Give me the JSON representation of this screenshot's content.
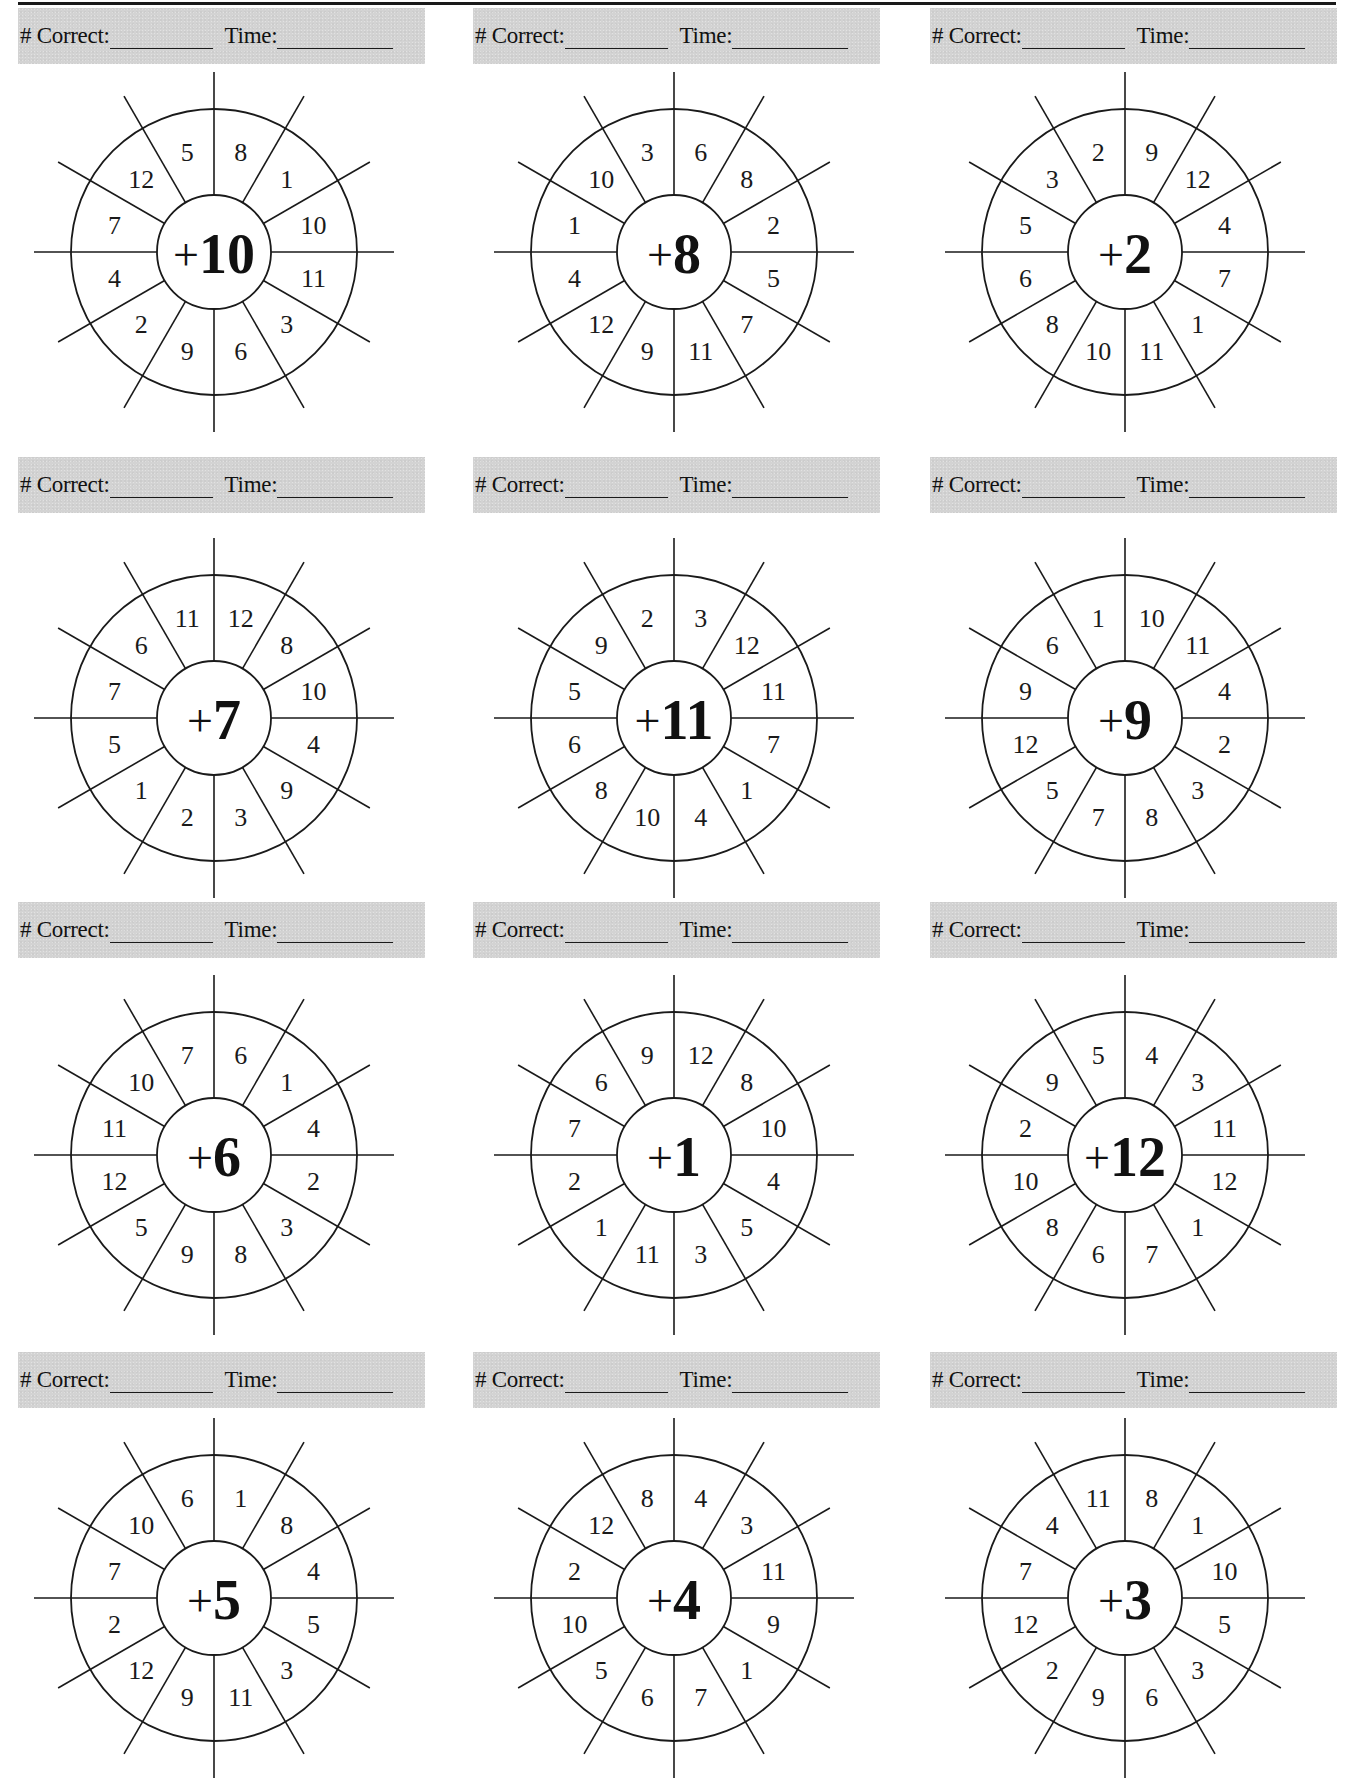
{
  "page": {
    "header_labels": {
      "correct": "# Correct:",
      "time": "Time:"
    },
    "colors": {
      "header_bg": "#d3d3d3",
      "line": "#1a1a1a",
      "text": "#111111"
    }
  },
  "worksheets": [
    {
      "operator": "+",
      "addend": "10",
      "numbers_clockwise_from_top": [
        "8",
        "1",
        "10",
        "11",
        "3",
        "6",
        "9",
        "2",
        "4",
        "7",
        "12",
        "5"
      ]
    },
    {
      "operator": "+",
      "addend": "8",
      "numbers_clockwise_from_top": [
        "6",
        "8",
        "2",
        "5",
        "7",
        "11",
        "9",
        "12",
        "4",
        "1",
        "10",
        "3"
      ]
    },
    {
      "operator": "+",
      "addend": "2",
      "numbers_clockwise_from_top": [
        "9",
        "12",
        "4",
        "7",
        "1",
        "11",
        "10",
        "8",
        "6",
        "5",
        "3",
        "2"
      ]
    },
    {
      "operator": "+",
      "addend": "7",
      "numbers_clockwise_from_top": [
        "12",
        "8",
        "10",
        "4",
        "9",
        "3",
        "2",
        "1",
        "5",
        "7",
        "6",
        "11"
      ]
    },
    {
      "operator": "+",
      "addend": "11",
      "numbers_clockwise_from_top": [
        "3",
        "12",
        "11",
        "7",
        "1",
        "4",
        "10",
        "8",
        "6",
        "5",
        "9",
        "2"
      ]
    },
    {
      "operator": "+",
      "addend": "9",
      "numbers_clockwise_from_top": [
        "10",
        "11",
        "4",
        "2",
        "3",
        "8",
        "7",
        "5",
        "12",
        "9",
        "6",
        "1"
      ]
    },
    {
      "operator": "+",
      "addend": "6",
      "numbers_clockwise_from_top": [
        "6",
        "1",
        "4",
        "2",
        "3",
        "8",
        "9",
        "5",
        "12",
        "11",
        "10",
        "7"
      ]
    },
    {
      "operator": "+",
      "addend": "1",
      "numbers_clockwise_from_top": [
        "12",
        "8",
        "10",
        "4",
        "5",
        "3",
        "11",
        "1",
        "2",
        "7",
        "6",
        "9"
      ]
    },
    {
      "operator": "+",
      "addend": "12",
      "numbers_clockwise_from_top": [
        "4",
        "3",
        "11",
        "12",
        "1",
        "7",
        "6",
        "8",
        "10",
        "2",
        "9",
        "5"
      ]
    },
    {
      "operator": "+",
      "addend": "5",
      "numbers_clockwise_from_top": [
        "1",
        "8",
        "4",
        "5",
        "3",
        "11",
        "9",
        "12",
        "2",
        "7",
        "10",
        "6"
      ]
    },
    {
      "operator": "+",
      "addend": "4",
      "numbers_clockwise_from_top": [
        "4",
        "3",
        "11",
        "9",
        "1",
        "7",
        "6",
        "5",
        "10",
        "2",
        "12",
        "8"
      ]
    },
    {
      "operator": "+",
      "addend": "3",
      "numbers_clockwise_from_top": [
        "8",
        "1",
        "10",
        "5",
        "3",
        "6",
        "9",
        "2",
        "12",
        "7",
        "4",
        "11"
      ]
    }
  ]
}
